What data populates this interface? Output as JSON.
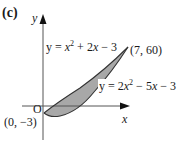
{
  "figure": {
    "part_label": "(c)",
    "axes": {
      "x_label": "x",
      "y_label": "y",
      "origin_label": "O"
    },
    "curves": [
      {
        "name": "upper",
        "equation": "y = x² + 2x − 3",
        "parts": [
          "y = ",
          "x",
          "2",
          " + 2",
          "x",
          " − 3"
        ]
      },
      {
        "name": "lower",
        "equation": "y = 2x² − 5x − 3",
        "parts": [
          "y = 2",
          "x",
          "2",
          " − 5",
          "x",
          " − 3"
        ]
      }
    ],
    "points": [
      {
        "label": "(7, 60)",
        "x": 7,
        "y": 60
      },
      {
        "label": "(0, −3)",
        "x": 0,
        "y": -3
      }
    ],
    "colors": {
      "line": "#333333",
      "fill": "#a8a8a8",
      "text": "#1a1a1a"
    }
  }
}
